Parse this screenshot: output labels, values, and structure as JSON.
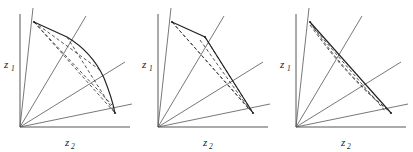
{
  "figure": {
    "panel_count": 3,
    "background_color": "#ffffff",
    "line_color": "#333333",
    "axis_color": "#444444",
    "ray_color": "#555555",
    "dashed_color": "#333333"
  },
  "panels": [
    {
      "id": "panel-a",
      "name": "panel-curved-frontier",
      "axis_vertical_label": "z",
      "axis_vertical_sub": "1",
      "axis_horizontal_label": "z",
      "axis_horizontal_sub": "2",
      "origin": {
        "x": 20,
        "y": 127
      },
      "vertical_axis_end": {
        "x": 20,
        "y": 14
      },
      "horizontal_axis_end": {
        "x": 130,
        "y": 127
      },
      "rays": [
        {
          "name": "ray-steep",
          "to": {
            "x": 33,
            "y": 8
          }
        },
        {
          "name": "ray-upper-mid",
          "to": {
            "x": 86,
            "y": 16
          }
        },
        {
          "name": "ray-mid",
          "to": {
            "x": 125,
            "y": 62
          }
        },
        {
          "name": "ray-lower",
          "to": {
            "x": 132,
            "y": 104
          }
        }
      ],
      "vertices": [
        {
          "name": "vertex-top",
          "x": 34,
          "y": 22
        },
        {
          "name": "vertex-upper",
          "x": 67,
          "y": 37
        },
        {
          "name": "vertex-mid",
          "x": 100,
          "y": 70
        },
        {
          "name": "vertex-right",
          "x": 115,
          "y": 113
        }
      ],
      "frontier_type": "curved",
      "frontier_path": "M 34 22 L 67 37 Q 92 52 104 78 Q 112 98 115 113",
      "dashed_chords": [
        {
          "name": "chord-top-to-mid",
          "from": {
            "x": 34,
            "y": 22
          },
          "to": {
            "x": 100,
            "y": 70
          }
        },
        {
          "name": "chord-top-to-right",
          "from": {
            "x": 34,
            "y": 22
          },
          "to": {
            "x": 115,
            "y": 113
          }
        },
        {
          "name": "chord-top-to-upper-right",
          "from": {
            "x": 34,
            "y": 22
          },
          "to": {
            "x": 112,
            "y": 105
          }
        },
        {
          "name": "chord-upper-to-right",
          "from": {
            "x": 67,
            "y": 37
          },
          "to": {
            "x": 115,
            "y": 113
          }
        }
      ]
    },
    {
      "id": "panel-b",
      "name": "panel-two-segment-frontier",
      "axis_vertical_label": "z",
      "axis_vertical_sub": "1",
      "axis_horizontal_label": "z",
      "axis_horizontal_sub": "2",
      "origin": {
        "x": 20,
        "y": 127
      },
      "vertical_axis_end": {
        "x": 20,
        "y": 14
      },
      "horizontal_axis_end": {
        "x": 130,
        "y": 127
      },
      "rays": [
        {
          "name": "ray-steep",
          "to": {
            "x": 33,
            "y": 8
          }
        },
        {
          "name": "ray-upper-mid",
          "to": {
            "x": 86,
            "y": 16
          }
        },
        {
          "name": "ray-mid",
          "to": {
            "x": 125,
            "y": 62
          }
        },
        {
          "name": "ray-lower",
          "to": {
            "x": 132,
            "y": 104
          }
        }
      ],
      "vertices": [
        {
          "name": "vertex-top",
          "x": 34,
          "y": 22
        },
        {
          "name": "vertex-upper",
          "x": 67,
          "y": 37
        },
        {
          "name": "vertex-right",
          "x": 115,
          "y": 113
        }
      ],
      "frontier_type": "piecewise-linear",
      "frontier_path": "M 34 22 L 67 37 L 115 113",
      "dashed_chords": [
        {
          "name": "chord-top-to-right",
          "from": {
            "x": 34,
            "y": 22
          },
          "to": {
            "x": 115,
            "y": 113
          }
        },
        {
          "name": "chord-top-inner",
          "from": {
            "x": 34,
            "y": 22
          },
          "to": {
            "x": 110,
            "y": 108
          }
        },
        {
          "name": "chord-upper-to-right",
          "from": {
            "x": 67,
            "y": 37
          },
          "to": {
            "x": 115,
            "y": 113
          }
        },
        {
          "name": "chord-upper-inner",
          "from": {
            "x": 62,
            "y": 40
          },
          "to": {
            "x": 112,
            "y": 110
          }
        }
      ]
    },
    {
      "id": "panel-c",
      "name": "panel-single-segment-frontier",
      "axis_vertical_label": "z",
      "axis_vertical_sub": "1",
      "axis_horizontal_label": "z",
      "axis_horizontal_sub": "2",
      "origin": {
        "x": 20,
        "y": 127
      },
      "vertical_axis_end": {
        "x": 20,
        "y": 14
      },
      "horizontal_axis_end": {
        "x": 130,
        "y": 127
      },
      "rays": [
        {
          "name": "ray-steep",
          "to": {
            "x": 33,
            "y": 8
          }
        },
        {
          "name": "ray-upper-mid",
          "to": {
            "x": 86,
            "y": 16
          }
        },
        {
          "name": "ray-mid",
          "to": {
            "x": 125,
            "y": 62
          }
        },
        {
          "name": "ray-lower",
          "to": {
            "x": 132,
            "y": 104
          }
        }
      ],
      "vertices": [
        {
          "name": "vertex-top",
          "x": 34,
          "y": 22
        },
        {
          "name": "vertex-right",
          "x": 115,
          "y": 113
        }
      ],
      "frontier_type": "linear",
      "frontier_path": "M 34 22 L 115 113",
      "dashed_chords": [
        {
          "name": "chord-inner-upper",
          "from": {
            "x": 34,
            "y": 25
          },
          "to": {
            "x": 112,
            "y": 110
          }
        },
        {
          "name": "chord-inner-lower",
          "from": {
            "x": 37,
            "y": 27
          },
          "to": {
            "x": 110,
            "y": 112
          }
        },
        {
          "name": "chord-curve-inner",
          "from": {
            "x": 35,
            "y": 24
          },
          "to": {
            "x": 113,
            "y": 111
          }
        }
      ]
    }
  ]
}
